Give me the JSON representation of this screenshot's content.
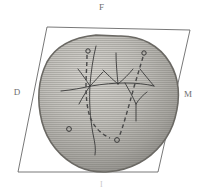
{
  "figure": {
    "type": "scientific-diagram",
    "background_color": "#ffffff",
    "frame": {
      "name": "parallelogram-frame",
      "stroke_color": "#555555",
      "stroke_width": 0.8,
      "points": "47,27 190,30 158,172 18,172"
    },
    "labels": {
      "top": "F",
      "left": "D",
      "right": "M",
      "bottom": "I",
      "color": "#6e6e6e",
      "bottom_color": "#c9c9c9"
    },
    "blob": {
      "name": "shaded-region",
      "fill_light": "#cfcdc8",
      "fill_mid": "#b4b2ad",
      "fill_dark": "#8f8d89",
      "edge_color": "#6b6964",
      "path": "M 118,36 C 141,35 160,46 170,63 C 180,80 180,100 175,118 C 170,137 156,154 139,163 C 120,173 97,175 79,167 C 60,158 47,141 42,122 C 37,102 38,80 47,62 C 57,44 76,37 96,35 Z"
    },
    "solid_lines": {
      "name": "branching-network",
      "stroke_color": "#3a3a3a",
      "stroke_width": 0.9,
      "paths": [
        "M 96,46 C 93,58 91,72 90,85 C 89,100 90,118 93,134 C 95,143 96,149 95,155",
        "M 61,91 C 72,90 82,88 91,86 C 103,84 114,83 125,83 C 136,83 146,84 154,86",
        "M 90,86 C 86,80 82,74 78,69",
        "M 90,86 C 86,92 82,98 79,104",
        "M 90,86 C 95,81 99,76 103,72",
        "M 118,84 C 117,73 116,63 116,53",
        "M 118,84 C 112,79 107,74 103,70",
        "M 118,84 C 124,79 129,74 133,69",
        "M 125,83 C 129,90 133,97 136,104",
        "M 136,104 C 139,99 143,95 147,92",
        "M 136,104 C 136,110 136,116 136,121",
        "M 154,86 C 149,80 144,74 140,69"
      ]
    },
    "dashed_lines": {
      "name": "dashed-paths",
      "stroke_color": "#4a4a4a",
      "stroke_width": 1.4,
      "dash_pattern": "4 3",
      "paths": [
        "M 87,55 C 87,65 86,75 86,85 C 86,97 87,108 90,117 C 94,127 101,134 110,138",
        "M 143,57 C 140,67 137,77 134,87 C 131,98 128,109 125,119 C 123,126 121,132 119,137"
      ]
    },
    "circles": [
      {
        "name": "node-circle-top-left",
        "cx": 88,
        "cy": 51,
        "r": 2.2
      },
      {
        "name": "node-circle-top-right",
        "cx": 144,
        "cy": 53,
        "r": 2.2
      },
      {
        "name": "node-circle-lower-left",
        "cx": 69,
        "cy": 129,
        "r": 2.4
      },
      {
        "name": "node-circle-bottom",
        "cx": 117,
        "cy": 140,
        "r": 2.4
      }
    ],
    "circle_style": {
      "stroke_color": "#3a3a3a",
      "stroke_width": 1.0,
      "fill": "none"
    },
    "texture": {
      "name": "horizontal-scanline-texture",
      "line_color": "rgba(110,108,104,0.30)",
      "spacing_px": 2
    }
  }
}
